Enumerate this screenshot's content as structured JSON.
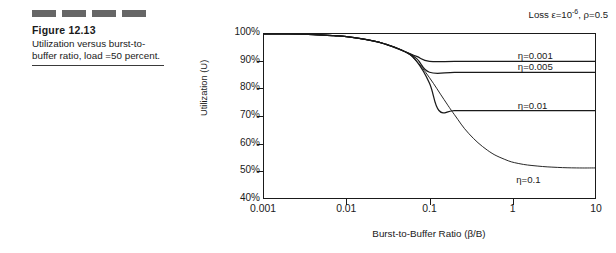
{
  "figure": {
    "decor_dashes": 4,
    "title": "Figure  12.13",
    "caption": "Utilization versus burst-to-buffer ratio, load =50 percent."
  },
  "chart_data": {
    "type": "line",
    "title": "",
    "annotation": "Loss ε=10⁻⁶,  ρ=0.5",
    "annotation_parts": {
      "prefix": "Loss ε=10",
      "exponent": "-6",
      "suffix": ",  ρ=0.5"
    },
    "xlabel": "Burst-to-Buffer Ratio (β/B)",
    "ylabel": "Utilization (U)",
    "xscale": "log",
    "xlim": [
      0.001,
      10
    ],
    "ylim": [
      40,
      100
    ],
    "yunit": "%",
    "grid": false,
    "legend": "inline-labels",
    "xticks": [
      0.001,
      0.01,
      0.1,
      1,
      10
    ],
    "xtick_labels": [
      "0.001",
      "0.01",
      "0.1",
      "1",
      "10"
    ],
    "yticks": [
      40,
      50,
      60,
      70,
      80,
      90,
      100
    ],
    "ytick_labels": [
      "40%",
      "50%",
      "60%",
      "70%",
      "80%",
      "90%",
      "100%"
    ],
    "series": [
      {
        "name": "η=0.001",
        "label": "η=0.001",
        "plateau": 90,
        "label_x": 1.15,
        "label_y": 91.8,
        "x": [
          0.001,
          0.002,
          0.004,
          0.007,
          0.01,
          0.02,
          0.03,
          0.05,
          0.07,
          0.1,
          0.2,
          0.4,
          1,
          3,
          10
        ],
        "y": [
          100,
          100,
          99.8,
          99.4,
          99,
          97.6,
          96.2,
          93.6,
          91.8,
          90,
          90,
          90,
          90,
          90,
          90
        ]
      },
      {
        "name": "η=0.005",
        "label": "η=0.005",
        "plateau": 86,
        "label_x": 1.15,
        "label_y": 87.6,
        "x": [
          0.001,
          0.002,
          0.004,
          0.007,
          0.01,
          0.02,
          0.03,
          0.05,
          0.07,
          0.1,
          0.2,
          0.4,
          1,
          3,
          10
        ],
        "y": [
          100,
          100,
          99.8,
          99.4,
          99,
          97.6,
          96.2,
          93.6,
          91.0,
          86,
          86,
          86,
          86,
          86,
          86
        ]
      },
      {
        "name": "η=0.01",
        "label": "η=0.01",
        "plateau": 72,
        "label_x": 1.15,
        "label_y": 73.6,
        "x": [
          0.001,
          0.002,
          0.004,
          0.007,
          0.01,
          0.02,
          0.03,
          0.05,
          0.07,
          0.1,
          0.13,
          0.2,
          0.4,
          1,
          3,
          10
        ],
        "y": [
          100,
          100,
          99.8,
          99.4,
          99,
          97.6,
          96.2,
          93.6,
          90.0,
          82.0,
          72,
          72,
          72,
          72,
          72,
          72
        ]
      },
      {
        "name": "η=0.1",
        "label": "η=0.1",
        "plateau": 51,
        "label_x": 1.1,
        "label_y": 47.0,
        "x": [
          0.001,
          0.002,
          0.004,
          0.007,
          0.01,
          0.02,
          0.03,
          0.05,
          0.07,
          0.1,
          0.15,
          0.2,
          0.3,
          0.5,
          0.8,
          1.2,
          2,
          3.5,
          6,
          10
        ],
        "y": [
          100,
          100,
          99.8,
          99.4,
          99,
          97.6,
          96.2,
          93.6,
          90.0,
          84.0,
          76.0,
          70.5,
          63.5,
          57.5,
          54.2,
          52.6,
          51.7,
          51.2,
          51.0,
          51.0
        ]
      }
    ]
  }
}
